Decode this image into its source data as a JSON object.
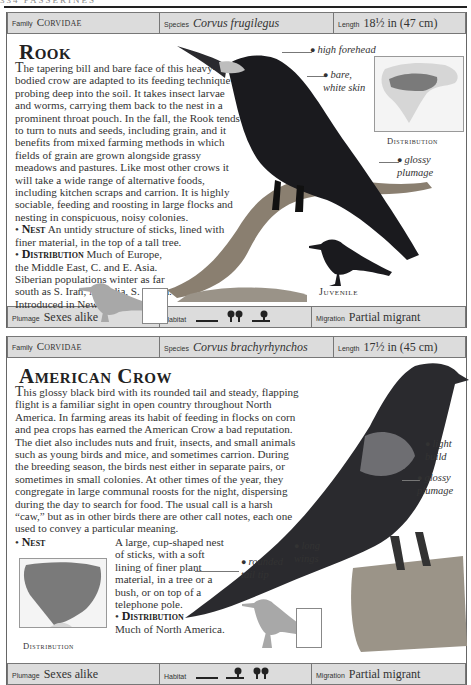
{
  "page": {
    "running_head": "334 PASSERINES"
  },
  "entries": [
    {
      "bar": {
        "family_label": "Family",
        "family": "Corvidae",
        "species_label": "Species",
        "species": "Corvus frugilegus",
        "length_label": "Length",
        "length": "18½ in (47 cm)"
      },
      "title": "Rook",
      "description_lead": "T",
      "description": "he tapering bill and bare face of this heavy-bodied crow are adapted to its feeding technique of probing deep into the soil. It takes insect larvae and worms, carrying them back to the nest in a prominent throat pouch. In the fall, the Rook tends to turn to nuts and seeds, including grain, and it benefits from mixed farming methods in which fields of grain are grown alongside grassy meadows and pastures. Like most other crows it will take a wide range of alternative foods, including kitchen scraps and carrion. It is highly sociable, feeding and roosting in large flocks and nesting in conspicuous, noisy colonies.",
      "nest_heading": "Nest",
      "nest": "An untidy structure of sticks, lined with finer material, in the top of a tall tree.",
      "distribution_heading": "Distribution",
      "distribution": "Much of Europe, the Middle East, C. and E. Asia. Siberian populations winter as far south as S. Iran, N. India, S. China. Introduced in New Zealand.",
      "callouts": [
        {
          "text": "high forehead"
        },
        {
          "text": "bare, white skin"
        },
        {
          "text": "glossy plumage"
        }
      ],
      "map_label": "Distribution",
      "juvenile_label": "Juvenile",
      "footer": {
        "plumage_label": "Plumage",
        "plumage": "Sexes alike",
        "habitat_label": "Habitat",
        "habitat_icons": [
          "grassland-icon",
          "woodland-icon",
          "farmland-icon"
        ],
        "migration_label": "Migration",
        "migration": "Partial migrant"
      }
    },
    {
      "bar": {
        "family_label": "Family",
        "family": "Corvidae",
        "species_label": "Species",
        "species": "Corvus brachyrhynchos",
        "length_label": "Length",
        "length": "17½ in (45 cm)"
      },
      "title": "American Crow",
      "description_lead": "T",
      "description": "his glossy black bird with its rounded tail and steady, flapping flight is a familiar sight in open country throughout North America. In farming areas its habit of feeding in flocks on corn and pea crops has earned the American Crow a bad reputation. The diet also includes nuts and fruit, insects, and small animals such as young birds and mice, and sometimes carrion. During the breeding season, the birds nest either in separate pairs, or sometimes in small colonies. At other times of the year, they congregate in large communal roosts for the night, dispersing during the day to search for food. The usual call is a harsh “caw,” but as in other birds there are other call notes, each one used to convey a particular meaning.",
      "nest_heading": "Nest",
      "nest": "A large, cup-shaped nest of sticks, with a soft lining of finer plant material, in a tree or a bush, or on top of a telephone pole.",
      "distribution_heading": "Distribution",
      "distribution": "Much of North America.",
      "callouts": [
        {
          "text": "light build"
        },
        {
          "text": "glossy plumage"
        },
        {
          "text": "long wings"
        },
        {
          "text": "rounded tail tip"
        }
      ],
      "map_label": "Distribution",
      "footer": {
        "plumage_label": "Plumage",
        "plumage": "Sexes alike",
        "habitat_label": "Habitat",
        "habitat_icons": [
          "grassland-icon",
          "farmland-icon",
          "woodland-icon"
        ],
        "migration_label": "Migration",
        "migration": "Partial migrant"
      }
    }
  ],
  "colors": {
    "bar_bg": "#dcdcdc",
    "bird_black": "#1a1a1e",
    "silhouette_grey": "#a8a8a8",
    "map_range": "#7a7a7a"
  }
}
